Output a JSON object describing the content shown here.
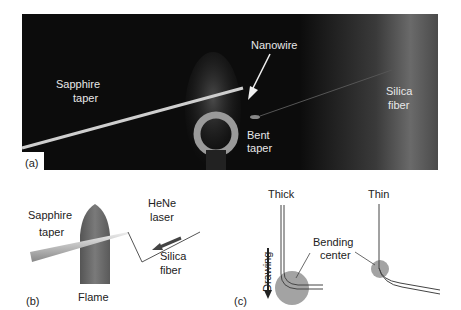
{
  "panel_a": {
    "panel_label": "(a)",
    "labels": {
      "sapphire_taper_line1": "Sapphire",
      "sapphire_taper_line2": "taper",
      "nanowire": "Nanowire",
      "silica_fiber_line1": "Silica",
      "silica_fiber_line2": "fiber",
      "bent_taper_line1": "Bent",
      "bent_taper_line2": "taper"
    }
  },
  "panel_b": {
    "panel_label": "(b)",
    "labels": {
      "sapphire_taper_line1": "Sapphire",
      "sapphire_taper_line2": "taper",
      "laser_line1": "HeNe",
      "laser_line2": "laser",
      "silica_fiber_line1": "Silica",
      "silica_fiber_line2": "fiber",
      "flame": "Flame"
    }
  },
  "panel_c": {
    "panel_label": "(c)",
    "labels": {
      "thick": "Thick",
      "thin": "Thin",
      "bending_line1": "Bending",
      "bending_line2": "center",
      "drawing": "Drawing"
    }
  },
  "colors": {
    "photo_bg": "#0c0c0c",
    "flame": "#6e6e6e",
    "circle": "#a3a3a3",
    "text_light": "#e8e8e8",
    "text_dark": "#222222"
  }
}
